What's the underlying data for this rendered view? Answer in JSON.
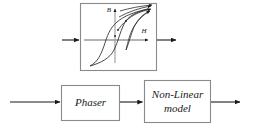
{
  "figure": {
    "type": "block-diagram",
    "background": "#ffffff",
    "stroke_color": "#333333",
    "axis_color": "#8c8c8c",
    "box_border_color": "#808080"
  },
  "upper_diagram": {
    "name": "hysteresis-curve-block",
    "box": {
      "x": 80,
      "y": 3,
      "width": 77,
      "height": 68
    },
    "input_arrow": {
      "from_x": 62,
      "to_x": 80,
      "y": 40
    },
    "output_arrow": {
      "from_x": 157,
      "to_x": 177,
      "y": 40
    },
    "axes": {
      "vertical_label": "B",
      "horizontal_label": "H",
      "vertical_label_pos": {
        "x": 109,
        "y": 10
      },
      "horizontal_label_pos": {
        "x": 144,
        "y": 32
      },
      "origin": {
        "x": 115,
        "y": 40
      },
      "v_top": 8,
      "v_bottom": 63,
      "h_left": 84,
      "h_right": 150
    },
    "curves": {
      "description": "B-H magnetic hysteresis loop with minor loops and reversal arrows",
      "count": 3
    }
  },
  "lower_diagram": {
    "name": "signal-chain",
    "input_arrow": {
      "from_x": 10,
      "to_x": 61,
      "y": 102
    },
    "blocks": [
      {
        "id": "phaser",
        "label": "Phaser",
        "lines": [
          "Phaser"
        ],
        "x": 61,
        "y": 85,
        "width": 59,
        "height": 36
      },
      {
        "id": "nonlinear-model",
        "label": "Non-Linear model",
        "lines": [
          "Non-Linear",
          "model"
        ],
        "x": 144,
        "y": 80,
        "width": 67,
        "height": 43
      }
    ],
    "connector_arrow": {
      "from_x": 120,
      "to_x": 143,
      "y": 102
    },
    "output_arrow": {
      "from_x": 211,
      "to_x": 241,
      "y": 102
    }
  }
}
